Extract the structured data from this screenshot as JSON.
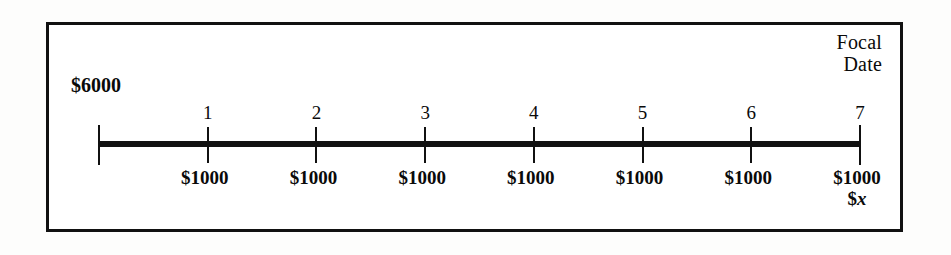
{
  "figure": {
    "present_value_label": "$6000",
    "focal_date_caption": [
      "Focal",
      "Date"
    ],
    "unknown_label_sigil": "$",
    "unknown_label_symbol": "x"
  },
  "chart_data": {
    "type": "line",
    "title": "",
    "subtitle": "",
    "xlabel": "",
    "ylabel": "",
    "grid": false,
    "legend": "none",
    "axis_range": [
      0,
      7
    ],
    "tick_positions": [
      0,
      1,
      2,
      3,
      4,
      5,
      6,
      7
    ],
    "tick_labels": [
      "",
      "1",
      "2",
      "3",
      "4",
      "5",
      "6",
      "7"
    ],
    "categories": [
      "0",
      "1",
      "2",
      "3",
      "4",
      "5",
      "6",
      "7"
    ],
    "below_axis_labels": [
      "",
      "$1000",
      "$1000",
      "$1000",
      "$1000",
      "$1000",
      "$1000",
      "$1000"
    ],
    "values": [
      0,
      1000,
      1000,
      1000,
      1000,
      1000,
      1000,
      1000
    ],
    "annotations": [
      {
        "text": "$6000",
        "position": "above-left-of-axis-origin"
      },
      {
        "text": "Focal Date",
        "position": "above-right-end-of-axis"
      },
      {
        "text": "$x",
        "position": "below-last-payment-at-period-7"
      }
    ]
  },
  "timeline": {
    "origin": {
      "index": 0,
      "number": "",
      "payment": "",
      "is_endpoint": true
    },
    "points": [
      {
        "index": 1,
        "number": "1",
        "payment": "$1000",
        "is_endpoint": false
      },
      {
        "index": 2,
        "number": "2",
        "payment": "$1000",
        "is_endpoint": false
      },
      {
        "index": 3,
        "number": "3",
        "payment": "$1000",
        "is_endpoint": false
      },
      {
        "index": 4,
        "number": "4",
        "payment": "$1000",
        "is_endpoint": false
      },
      {
        "index": 5,
        "number": "5",
        "payment": "$1000",
        "is_endpoint": false
      },
      {
        "index": 6,
        "number": "6",
        "payment": "$1000",
        "is_endpoint": false
      },
      {
        "index": 7,
        "number": "7",
        "payment": "$1000",
        "is_endpoint": true
      }
    ]
  },
  "colors": {
    "ink": "#111111",
    "panel_background": "#ffffff",
    "page_background": "#fdfdfc"
  }
}
